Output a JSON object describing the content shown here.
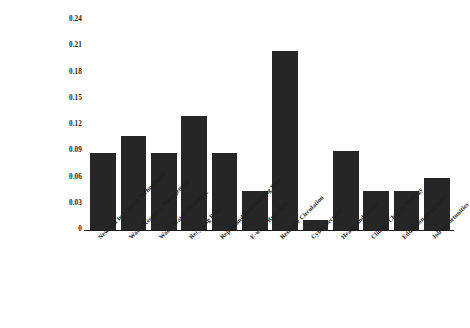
{
  "chart_data": {
    "type": "bar",
    "title": "",
    "xlabel": "",
    "ylabel": "",
    "ylim": [
      0,
      0.24
    ],
    "grid": false,
    "legend": "none",
    "yticks": [
      "0.24",
      "0.21",
      "0.18",
      "0.15",
      "0.12",
      "0.09",
      "0.06",
      "0.03",
      "0"
    ],
    "ytick_values": [
      0.24,
      0.21,
      0.18,
      0.15,
      0.12,
      0.09,
      0.06,
      0.03,
      0
    ],
    "bar_color": "#262626",
    "categories": [
      "New and Innovative Technologies",
      "Water Resource Management",
      "Waste Water Treatment",
      "Recycling Rate",
      "Repair and Refurbishing Rate",
      "E-waste Recycling",
      "Resource Circulation",
      "Cyber Security",
      "Health and Safety",
      "Climate Change Strategy",
      "Education and Equity",
      "Job opportunities"
    ],
    "values": [
      0.088,
      0.107,
      0.088,
      0.13,
      0.088,
      0.045,
      0.205,
      0.012,
      0.09,
      0.045,
      0.045,
      0.06
    ]
  }
}
